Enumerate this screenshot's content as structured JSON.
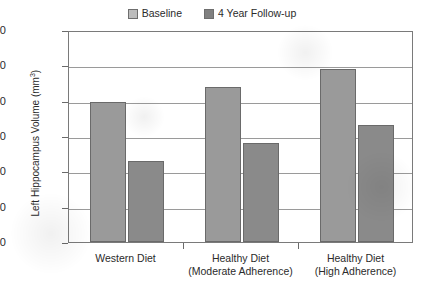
{
  "chart_data": {
    "type": "bar",
    "title": "",
    "xlabel": "",
    "ylabel": "Left Hippocampus Volume (mm3)",
    "ylabel_main": "Left Hippocampus Volume (mm",
    "ylabel_sup": "3",
    "ylabel_close": ")",
    "categories": [
      "Western Diet",
      "Healthy Diet\n(Moderate Adherence)",
      "Healthy Diet\n(High Adherence)"
    ],
    "category_lines": [
      [
        "Western Diet",
        ""
      ],
      [
        "Healthy Diet",
        "(Moderate Adherence)"
      ],
      [
        "Healthy Diet",
        "(High Adherence)"
      ]
    ],
    "series": [
      {
        "name": "Baseline",
        "color": "#9a9a9a",
        "values": [
          2790,
          2880,
          2980
        ]
      },
      {
        "name": "4 Year Follow-up",
        "color": "#8a8a8a",
        "values": [
          2460,
          2560,
          2660
        ]
      }
    ],
    "ylim": [
      2000,
      3200
    ],
    "yticks": [
      3200,
      3000,
      2800,
      2600,
      2400,
      2200,
      2000
    ],
    "ytick_labels": [
      "3200",
      "3000",
      "2800",
      "2600",
      "2400",
      "2200",
      "2000"
    ],
    "grid": true,
    "legend_position": "top-center"
  },
  "legend": {
    "items": [
      {
        "label": "Baseline",
        "swatch_color": "#bdbdbd"
      },
      {
        "label": "4 Year Follow-up",
        "swatch_color": "#808080"
      }
    ]
  }
}
